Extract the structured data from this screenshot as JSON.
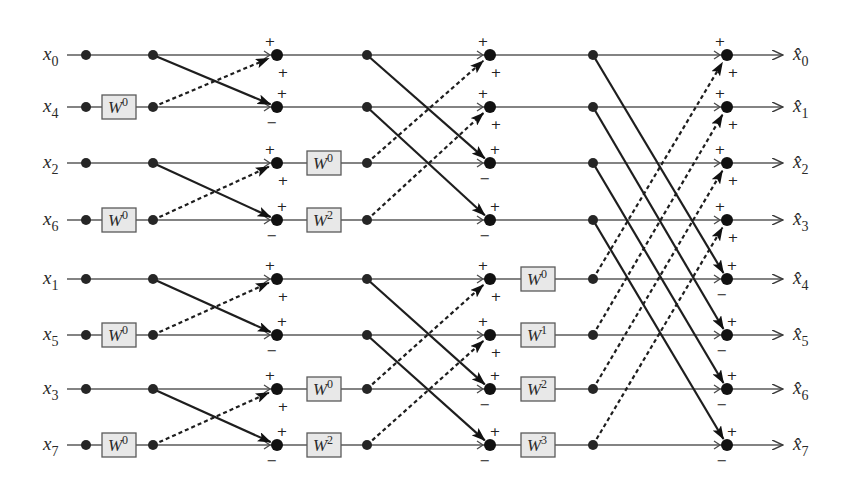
{
  "diagram": {
    "colors": {
      "line": "#5a5a5a",
      "edge": "#1e1e1e",
      "box_fill": "#e8e8e8",
      "node": "#262626"
    },
    "inputs": [
      {
        "base": "x",
        "sub": "0"
      },
      {
        "base": "x",
        "sub": "4"
      },
      {
        "base": "x",
        "sub": "2"
      },
      {
        "base": "x",
        "sub": "6"
      },
      {
        "base": "x",
        "sub": "1"
      },
      {
        "base": "x",
        "sub": "5"
      },
      {
        "base": "x",
        "sub": "3"
      },
      {
        "base": "x",
        "sub": "7"
      }
    ],
    "outputs": [
      {
        "base": "x̂",
        "sub": "0"
      },
      {
        "base": "x̂",
        "sub": "1"
      },
      {
        "base": "x̂",
        "sub": "2"
      },
      {
        "base": "x̂",
        "sub": "3"
      },
      {
        "base": "x̂",
        "sub": "4"
      },
      {
        "base": "x̂",
        "sub": "5"
      },
      {
        "base": "x̂",
        "sub": "6"
      },
      {
        "base": "x̂",
        "sub": "7"
      }
    ],
    "stages": [
      {
        "name": "stage-1",
        "span": 1,
        "twiddles": [
          {
            "row": 1,
            "base": "W",
            "exp": "0"
          },
          {
            "row": 3,
            "base": "W",
            "exp": "0"
          },
          {
            "row": 5,
            "base": "W",
            "exp": "0"
          },
          {
            "row": 7,
            "base": "W",
            "exp": "0"
          }
        ]
      },
      {
        "name": "stage-2",
        "span": 2,
        "twiddles": [
          {
            "row": 2,
            "base": "W",
            "exp": "0"
          },
          {
            "row": 3,
            "base": "W",
            "exp": "2"
          },
          {
            "row": 6,
            "base": "W",
            "exp": "0"
          },
          {
            "row": 7,
            "base": "W",
            "exp": "2"
          }
        ]
      },
      {
        "name": "stage-3",
        "span": 4,
        "twiddles": [
          {
            "row": 4,
            "base": "W",
            "exp": "0"
          },
          {
            "row": 5,
            "base": "W",
            "exp": "1"
          },
          {
            "row": 6,
            "base": "W",
            "exp": "2"
          },
          {
            "row": 7,
            "base": "W",
            "exp": "3"
          }
        ]
      }
    ],
    "signs": {
      "top_adder": [
        "+",
        "+"
      ],
      "bottom_adder": [
        "+",
        "−"
      ]
    }
  }
}
